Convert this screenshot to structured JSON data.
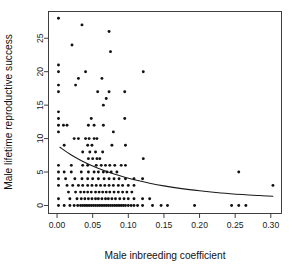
{
  "chart_data": {
    "type": "scatter",
    "title": "",
    "xlabel": "Male inbreeding coefficient",
    "ylabel": "Male lifetime reproductive success",
    "xlim": [
      -0.012,
      0.315
    ],
    "ylim": [
      -1.2,
      29.0
    ],
    "grid": false,
    "legend": null,
    "xticks": [
      0.0,
      0.05,
      0.1,
      0.15,
      0.2,
      0.25,
      0.3
    ],
    "xtick_labels": [
      "0.00",
      "0.05",
      "0.10",
      "0.15",
      "0.20",
      "0.25",
      "0.30"
    ],
    "yticks": [
      0,
      5,
      10,
      15,
      20,
      25
    ],
    "ytick_labels": [
      "0",
      "5",
      "10",
      "15",
      "20",
      "25"
    ],
    "marker": "filled-circle",
    "marker_color": "#111111",
    "fit_line_color": "#1a1a1a",
    "fit_curve_note": "Monotonic decreasing fitted regression curve from about (0.004, 8.7) to (0.303, 1.4)",
    "fit_curve": [
      [
        0.004,
        8.7
      ],
      [
        0.02,
        7.55
      ],
      [
        0.035,
        6.65
      ],
      [
        0.05,
        5.9
      ],
      [
        0.065,
        5.25
      ],
      [
        0.08,
        4.7
      ],
      [
        0.095,
        4.22
      ],
      [
        0.11,
        3.8
      ],
      [
        0.13,
        3.33
      ],
      [
        0.15,
        2.93
      ],
      [
        0.175,
        2.52
      ],
      [
        0.2,
        2.2
      ],
      [
        0.23,
        1.88
      ],
      [
        0.26,
        1.64
      ],
      [
        0.285,
        1.48
      ],
      [
        0.303,
        1.38
      ]
    ],
    "points": [
      [
        0.002,
        28
      ],
      [
        0.035,
        27
      ],
      [
        0.073,
        26
      ],
      [
        0.021,
        24
      ],
      [
        0.075,
        23
      ],
      [
        0.002,
        21
      ],
      [
        0.002,
        20
      ],
      [
        0.04,
        20
      ],
      [
        0.121,
        20
      ],
      [
        0.03,
        19
      ],
      [
        0.063,
        19
      ],
      [
        0.002,
        18
      ],
      [
        0.026,
        18
      ],
      [
        0.002,
        17
      ],
      [
        0.057,
        17
      ],
      [
        0.073,
        17
      ],
      [
        0.095,
        17
      ],
      [
        0.069,
        16
      ],
      [
        0.065,
        15
      ],
      [
        0.002,
        14
      ],
      [
        0.002,
        13
      ],
      [
        0.048,
        13
      ],
      [
        0.095,
        13
      ],
      [
        0.002,
        12
      ],
      [
        0.009,
        12
      ],
      [
        0.014,
        12
      ],
      [
        0.044,
        12
      ],
      [
        0.052,
        12
      ],
      [
        0.065,
        12
      ],
      [
        0.002,
        11
      ],
      [
        0.079,
        11
      ],
      [
        0.024,
        10
      ],
      [
        0.03,
        10
      ],
      [
        0.04,
        10
      ],
      [
        0.045,
        10
      ],
      [
        0.052,
        10
      ],
      [
        0.056,
        10
      ],
      [
        0.01,
        9
      ],
      [
        0.043,
        9
      ],
      [
        0.049,
        9
      ],
      [
        0.077,
        9
      ],
      [
        0.096,
        9
      ],
      [
        0.036,
        8
      ],
      [
        0.046,
        8
      ],
      [
        0.054,
        8
      ],
      [
        0.064,
        8
      ],
      [
        0.044,
        7
      ],
      [
        0.05,
        7
      ],
      [
        0.056,
        7
      ],
      [
        0.06,
        7
      ],
      [
        0.121,
        7
      ],
      [
        0.002,
        6
      ],
      [
        0.02,
        6
      ],
      [
        0.036,
        6
      ],
      [
        0.043,
        6
      ],
      [
        0.055,
        6
      ],
      [
        0.062,
        6
      ],
      [
        0.068,
        6
      ],
      [
        0.074,
        6
      ],
      [
        0.081,
        6
      ],
      [
        0.09,
        6
      ],
      [
        0.096,
        6
      ],
      [
        0.002,
        5
      ],
      [
        0.01,
        5
      ],
      [
        0.02,
        5
      ],
      [
        0.034,
        5
      ],
      [
        0.044,
        5
      ],
      [
        0.052,
        5
      ],
      [
        0.058,
        5
      ],
      [
        0.065,
        5
      ],
      [
        0.07,
        5
      ],
      [
        0.076,
        5
      ],
      [
        0.084,
        5
      ],
      [
        0.255,
        5
      ],
      [
        0.002,
        4
      ],
      [
        0.012,
        4
      ],
      [
        0.025,
        4
      ],
      [
        0.035,
        4
      ],
      [
        0.043,
        4
      ],
      [
        0.05,
        4
      ],
      [
        0.058,
        4
      ],
      [
        0.066,
        4
      ],
      [
        0.073,
        4
      ],
      [
        0.08,
        4
      ],
      [
        0.087,
        4
      ],
      [
        0.096,
        4
      ],
      [
        0.108,
        4
      ],
      [
        0.12,
        4
      ],
      [
        0.002,
        3
      ],
      [
        0.014,
        3
      ],
      [
        0.022,
        3
      ],
      [
        0.03,
        3
      ],
      [
        0.036,
        3
      ],
      [
        0.043,
        3
      ],
      [
        0.049,
        3
      ],
      [
        0.055,
        3
      ],
      [
        0.061,
        3
      ],
      [
        0.067,
        3
      ],
      [
        0.073,
        3
      ],
      [
        0.079,
        3
      ],
      [
        0.086,
        3
      ],
      [
        0.092,
        3
      ],
      [
        0.1,
        3
      ],
      [
        0.108,
        3
      ],
      [
        0.303,
        3
      ],
      [
        0.016,
        2
      ],
      [
        0.026,
        2
      ],
      [
        0.033,
        2
      ],
      [
        0.038,
        2
      ],
      [
        0.043,
        2
      ],
      [
        0.048,
        2
      ],
      [
        0.054,
        2
      ],
      [
        0.059,
        2
      ],
      [
        0.064,
        2
      ],
      [
        0.069,
        2
      ],
      [
        0.074,
        2
      ],
      [
        0.08,
        2
      ],
      [
        0.086,
        2
      ],
      [
        0.092,
        2
      ],
      [
        0.098,
        2
      ],
      [
        0.105,
        2
      ],
      [
        0.002,
        1
      ],
      [
        0.018,
        1
      ],
      [
        0.028,
        1
      ],
      [
        0.034,
        1
      ],
      [
        0.039,
        1
      ],
      [
        0.044,
        1
      ],
      [
        0.049,
        1
      ],
      [
        0.054,
        1
      ],
      [
        0.058,
        1
      ],
      [
        0.063,
        1
      ],
      [
        0.068,
        1
      ],
      [
        0.072,
        1
      ],
      [
        0.077,
        1
      ],
      [
        0.082,
        1
      ],
      [
        0.088,
        1
      ],
      [
        0.094,
        1
      ],
      [
        0.1,
        1
      ],
      [
        0.108,
        1
      ],
      [
        0.12,
        1
      ],
      [
        0.13,
        1
      ],
      [
        0.002,
        0
      ],
      [
        0.01,
        0
      ],
      [
        0.018,
        0
      ],
      [
        0.024,
        0
      ],
      [
        0.029,
        0
      ],
      [
        0.033,
        0
      ],
      [
        0.036,
        0
      ],
      [
        0.039,
        0
      ],
      [
        0.042,
        0
      ],
      [
        0.045,
        0
      ],
      [
        0.048,
        0
      ],
      [
        0.051,
        0
      ],
      [
        0.054,
        0
      ],
      [
        0.057,
        0
      ],
      [
        0.06,
        0
      ],
      [
        0.063,
        0
      ],
      [
        0.066,
        0
      ],
      [
        0.069,
        0
      ],
      [
        0.072,
        0
      ],
      [
        0.075,
        0
      ],
      [
        0.078,
        0
      ],
      [
        0.081,
        0
      ],
      [
        0.084,
        0
      ],
      [
        0.087,
        0
      ],
      [
        0.09,
        0
      ],
      [
        0.093,
        0
      ],
      [
        0.096,
        0
      ],
      [
        0.1,
        0
      ],
      [
        0.104,
        0
      ],
      [
        0.108,
        0
      ],
      [
        0.113,
        0
      ],
      [
        0.12,
        0
      ],
      [
        0.134,
        0
      ],
      [
        0.146,
        0
      ],
      [
        0.155,
        0
      ],
      [
        0.193,
        0
      ],
      [
        0.245,
        0
      ],
      [
        0.255,
        0
      ],
      [
        0.265,
        0
      ]
    ]
  }
}
